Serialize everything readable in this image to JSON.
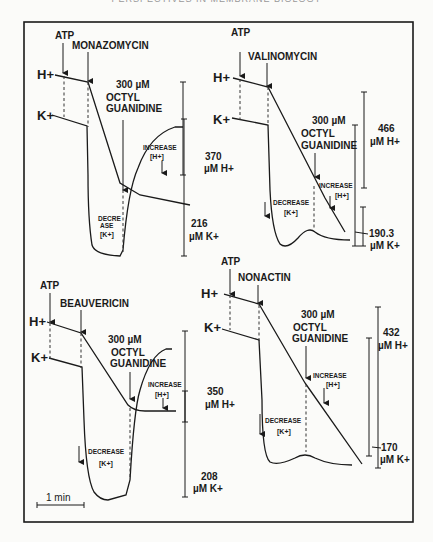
{
  "page_header": "PERSPECTIVES IN MEMBRANE BIOLOGY",
  "figure": {
    "scale_bar_label": "1 min",
    "colors": {
      "ink": "#1a1a1a",
      "paper": "#fbfbf9"
    },
    "panels": [
      {
        "id": "monazomycin",
        "ionophore": "MONAZOMYCIN",
        "atp_label": "ATP",
        "h_label": "H+",
        "k_label": "K+",
        "octyl_line1": "300 µM",
        "octyl_line2": "OCTYL",
        "octyl_line3": "GUANIDINE",
        "increase_label": "INCREASE",
        "increase_ion": "[H+]",
        "decrease_label_a": "DECRE",
        "decrease_label_b": "ASE",
        "decrease_ion": "[K+]",
        "h_scale_value": "370",
        "h_scale_unit": "µM H+",
        "k_scale_value": "216",
        "k_scale_unit": "µM K+"
      },
      {
        "id": "valinomycin",
        "ionophore": "VALINOMYCIN",
        "atp_label": "ATP",
        "h_label": "H+",
        "k_label": "K+",
        "octyl_line1": "300 µM",
        "octyl_line2": "OCTYL",
        "octyl_line3": "GUANIDINE",
        "increase_label": "INCREASE",
        "increase_ion": "[H+]",
        "decrease_label": "DECREASE",
        "decrease_ion": "[K+]",
        "h_scale_value": "466",
        "h_scale_unit": "µM H+",
        "k_scale_value": "190.3",
        "k_scale_unit": "µM K+"
      },
      {
        "id": "beauvericin",
        "ionophore": "BEAUVERICIN",
        "atp_label": "ATP",
        "h_label": "H+",
        "k_label": "K+",
        "octyl_line1": "300 µM",
        "octyl_line2": "OCTYL",
        "octyl_line3": "GUANIDINE",
        "increase_label": "INCREASE",
        "increase_ion": "[H+]",
        "decrease_label": "DECREASE",
        "decrease_ion": "[K+]",
        "h_scale_value": "350",
        "h_scale_unit": "µM H+",
        "k_scale_value": "208",
        "k_scale_unit": "µM K+"
      },
      {
        "id": "nonactin",
        "ionophore": "NONACTIN",
        "atp_label": "ATP",
        "h_label": "H+",
        "k_label": "K+",
        "octyl_line1": "300 µM",
        "octyl_line2": "OCTYL",
        "octyl_line3": "GUANIDINE",
        "increase_label": "INCREASE",
        "increase_ion": "[H+]",
        "decrease_label": "DECREASE",
        "decrease_ion": "[K+]",
        "h_scale_value": "432",
        "h_scale_unit": "µM H+",
        "k_scale_value": "170",
        "k_scale_unit": "µM K+"
      }
    ]
  }
}
